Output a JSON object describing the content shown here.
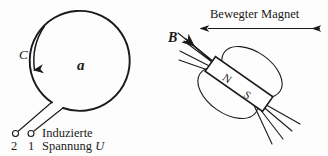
{
  "figure": {
    "background_color": "#fdfdfd",
    "ink_color": "#1a1a1a"
  },
  "loop": {
    "area_label": "a",
    "contour_label": "C",
    "contour_arrow_direction": "down",
    "center_x": 84,
    "center_y": 66,
    "radius": 50
  },
  "terminals": {
    "left_marker": "circle",
    "right_marker": "circle",
    "left_number": "2",
    "right_number": "1",
    "caption_line1": "Induzierte",
    "caption_line2": "Spannung",
    "caption_symbol": "U"
  },
  "magnet": {
    "north_label": "N",
    "south_label": "S",
    "field_label": "B",
    "motion_label": "Bewegter Magnet",
    "motion_arrow": "double-headed",
    "tilt_degrees": 35
  }
}
